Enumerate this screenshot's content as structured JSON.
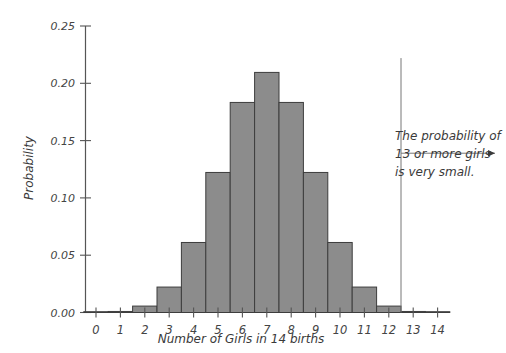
{
  "chart_data": {
    "type": "bar",
    "title": "",
    "subtitle": "",
    "xlabel": "Number of Girls in 14 births",
    "ylabel": "Probability",
    "categories": [
      "0",
      "1",
      "2",
      "3",
      "4",
      "5",
      "6",
      "7",
      "8",
      "9",
      "10",
      "11",
      "12",
      "13",
      "14"
    ],
    "values": [
      0.0001,
      0.0009,
      0.0056,
      0.0222,
      0.0611,
      0.1222,
      0.1833,
      0.2095,
      0.1833,
      0.1222,
      0.0611,
      0.0222,
      0.0056,
      0.0009,
      0.0001
    ],
    "xlim": [
      -0.5,
      14.5
    ],
    "ylim": [
      0.0,
      0.25
    ],
    "ytick_labels": [
      "0.00",
      "0.05",
      "0.10",
      "0.15",
      "0.20",
      "0.25"
    ],
    "ytick_values": [
      0.0,
      0.05,
      0.1,
      0.15,
      0.2,
      0.25
    ],
    "xtick_labels": [
      "0",
      "1",
      "2",
      "3",
      "4",
      "5",
      "6",
      "7",
      "8",
      "9",
      "10",
      "11",
      "12",
      "13",
      "14"
    ],
    "grid": false,
    "legend": false,
    "legend_position": "none",
    "bar_fill_color": "#8c8c8c",
    "bar_edge_color": "#3d3d3d",
    "axis_color": "#555555",
    "annotations": [
      {
        "name": "cutoff-line",
        "type": "vertical-line",
        "x_value": 12.5,
        "y_top": 0.222,
        "y_bottom": 0.0,
        "color": "#777777"
      },
      {
        "name": "probability-note",
        "type": "text-with-arrow",
        "lines": [
          "The probability of",
          "13 or more girls",
          "is very small."
        ],
        "arrow_direction": "right",
        "arrow_from_x": 12.5,
        "arrow_y_value": 0.139,
        "color": "#3a3a3a"
      }
    ]
  }
}
